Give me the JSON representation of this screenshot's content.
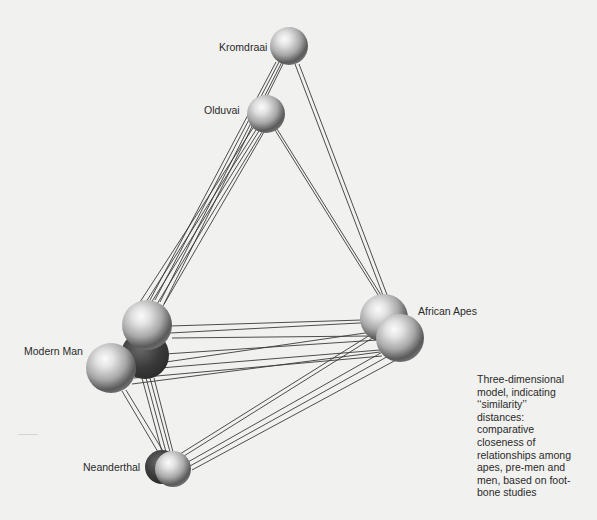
{
  "figure": {
    "type": "three-dimensional similarity model",
    "background_color": "#f1f1ef",
    "line_color": "#3a3a3a",
    "sphere_color": "#9a9a9a"
  },
  "nodes": [
    {
      "id": "kromdraai",
      "label": "Kromdraai",
      "label_pos": {
        "x": 219,
        "y": 42
      },
      "spheres": [
        {
          "cx": 289,
          "cy": 46,
          "r": 19
        }
      ]
    },
    {
      "id": "olduvai",
      "label": "Olduvai",
      "label_pos": {
        "x": 204,
        "y": 105
      },
      "spheres": [
        {
          "cx": 266,
          "cy": 114,
          "r": 19
        }
      ]
    },
    {
      "id": "modern-man",
      "label": "Modern Man",
      "label_pos": {
        "x": 24,
        "y": 346
      },
      "spheres": [
        {
          "cx": 145,
          "cy": 355,
          "r": 24,
          "shadow": true
        },
        {
          "cx": 147,
          "cy": 325,
          "r": 25
        },
        {
          "cx": 111,
          "cy": 368,
          "r": 25
        }
      ]
    },
    {
      "id": "african-apes",
      "label": "African Apes",
      "label_pos": {
        "x": 418,
        "y": 306
      },
      "spheres": [
        {
          "cx": 384,
          "cy": 318,
          "r": 24
        },
        {
          "cx": 400,
          "cy": 338,
          "r": 24
        }
      ]
    },
    {
      "id": "neanderthal",
      "label": "Neanderthal",
      "label_pos": {
        "x": 83,
        "y": 462
      },
      "spheres": [
        {
          "cx": 162,
          "cy": 467,
          "r": 17,
          "shadow": true
        },
        {
          "cx": 173,
          "cy": 469,
          "r": 18
        }
      ]
    }
  ],
  "edges": [
    {
      "from": "kromdraai",
      "to": "modern-man",
      "lines": [
        [
          276,
          62,
          150,
          300
        ],
        [
          279,
          62,
          155,
          300
        ],
        [
          282,
          62,
          160,
          302
        ],
        [
          284,
          62,
          164,
          304
        ]
      ]
    },
    {
      "from": "kromdraai",
      "to": "african-apes",
      "lines": [
        [
          295,
          64,
          384,
          298
        ],
        [
          299,
          64,
          389,
          300
        ]
      ]
    },
    {
      "from": "olduvai",
      "to": "modern-man",
      "lines": [
        [
          253,
          128,
          140,
          302
        ],
        [
          256,
          130,
          146,
          302
        ],
        [
          259,
          131,
          151,
          303
        ],
        [
          262,
          132,
          157,
          304
        ],
        [
          264,
          132,
          163,
          306
        ]
      ]
    },
    {
      "from": "olduvai",
      "to": "african-apes",
      "lines": [
        [
          275,
          130,
          380,
          298
        ],
        [
          277,
          129,
          384,
          300
        ]
      ]
    },
    {
      "from": "modern-man",
      "to": "african-apes",
      "lines": [
        [
          170,
          326,
          362,
          320
        ],
        [
          170,
          333,
          378,
          322
        ],
        [
          172,
          338,
          370,
          336
        ],
        [
          165,
          354,
          378,
          340
        ],
        [
          166,
          362,
          372,
          332
        ],
        [
          160,
          368,
          380,
          350
        ],
        [
          134,
          378,
          382,
          356
        ],
        [
          132,
          384,
          380,
          352
        ]
      ]
    },
    {
      "from": "modern-man",
      "to": "neanderthal",
      "lines": [
        [
          122,
          391,
          158,
          452
        ],
        [
          126,
          390,
          163,
          451
        ],
        [
          142,
          378,
          162,
          452
        ],
        [
          146,
          378,
          166,
          452
        ],
        [
          150,
          378,
          170,
          452
        ],
        [
          154,
          378,
          173,
          452
        ]
      ]
    },
    {
      "from": "african-apes",
      "to": "neanderthal",
      "lines": [
        [
          378,
          330,
          180,
          454
        ],
        [
          382,
          332,
          184,
          456
        ],
        [
          386,
          350,
          188,
          462
        ],
        [
          392,
          354,
          190,
          466
        ],
        [
          396,
          360,
          192,
          470
        ]
      ]
    }
  ],
  "caption": {
    "lines": [
      "Three-dimensional",
      "model, indicating",
      "‘‘similarity’’",
      "distances:",
      "comparative",
      "closeness of",
      "relationships among",
      "apes, pre-men and",
      "men, based on foot-",
      "bone studies"
    ]
  }
}
